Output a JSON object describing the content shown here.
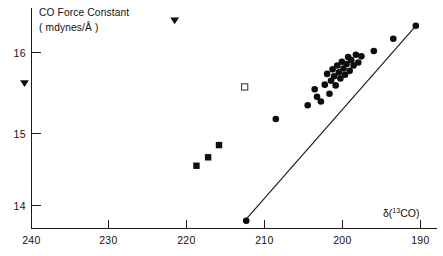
{
  "chart_data": {
    "type": "scatter",
    "title": "",
    "ylabel_line1": "CO Force Constant",
    "ylabel_line2": "( mdynes/Å )",
    "xlabel": "δ(¹³CO)",
    "xlabel_base": "δ(",
    "xlabel_sup": "13",
    "xlabel_tail": "CO)",
    "xlabel_unit": "ppm",
    "xlim": [
      244,
      188
    ],
    "ylim": [
      13.55,
      16.45
    ],
    "x_reversed": true,
    "grid": false,
    "legend": null,
    "xticks": [
      240,
      230,
      220,
      210,
      200,
      190
    ],
    "xticklabels": [
      "240",
      "230",
      "220",
      "210",
      "200",
      "190"
    ],
    "yticks": [
      16,
      15,
      14
    ],
    "yticklabels": [
      "16",
      "15",
      "14"
    ],
    "series": [
      {
        "name": "filled-circles",
        "marker": "circle",
        "fill": "#0d0d0d",
        "points": [
          [
            212.4,
            13.8
          ],
          [
            208.6,
            15.13
          ],
          [
            204.5,
            15.31
          ],
          [
            203.6,
            15.52
          ],
          [
            203.3,
            15.42
          ],
          [
            202.8,
            15.36
          ],
          [
            202.3,
            15.58
          ],
          [
            202.0,
            15.72
          ],
          [
            201.7,
            15.46
          ],
          [
            201.5,
            15.63
          ],
          [
            201.3,
            15.78
          ],
          [
            201.1,
            15.69
          ],
          [
            200.9,
            15.57
          ],
          [
            200.7,
            15.83
          ],
          [
            200.5,
            15.74
          ],
          [
            200.3,
            15.66
          ],
          [
            200.1,
            15.88
          ],
          [
            199.9,
            15.79
          ],
          [
            199.7,
            15.71
          ],
          [
            199.5,
            15.85
          ],
          [
            199.3,
            15.94
          ],
          [
            199.1,
            15.76
          ],
          [
            198.9,
            15.9
          ],
          [
            198.6,
            15.83
          ],
          [
            198.3,
            15.97
          ],
          [
            198.0,
            15.87
          ],
          [
            197.6,
            15.95
          ],
          [
            196.0,
            16.02
          ],
          [
            193.5,
            16.18
          ],
          [
            190.6,
            16.35
          ]
        ]
      },
      {
        "name": "filled-squares",
        "marker": "square",
        "fill": "#0d0d0d",
        "points": [
          [
            218.8,
            14.52
          ],
          [
            217.3,
            14.63
          ],
          [
            215.9,
            14.79
          ]
        ]
      },
      {
        "name": "open-square",
        "marker": "square-open",
        "fill": "#ffffff",
        "points": [
          [
            212.6,
            15.55
          ]
        ]
      },
      {
        "name": "filled-triangles-down",
        "marker": "triangle-down",
        "fill": "#0d0d0d",
        "points": [
          [
            240.9,
            15.6
          ],
          [
            221.6,
            16.42
          ]
        ]
      }
    ],
    "fit_line": {
      "name": "regression-line",
      "x_start": 212.6,
      "y_start": 13.8,
      "x_end": 190.4,
      "y_end": 16.37
    }
  }
}
